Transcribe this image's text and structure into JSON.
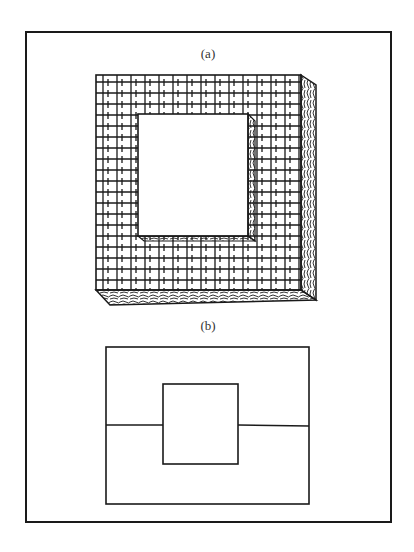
{
  "figure": {
    "panel_a": {
      "label": "(a)",
      "description": "Square frame block with cross-hatched front face, square hole in the center, textured right and bottom side faces"
    },
    "panel_b": {
      "label": "(b)",
      "description": "Line drawing: outer rectangle containing centered inner square, with a horizontal line through the middle connecting the inner square to the outer rectangle's sides"
    }
  },
  "colors": {
    "ink": "#1a1a1a",
    "background": "#ffffff"
  }
}
